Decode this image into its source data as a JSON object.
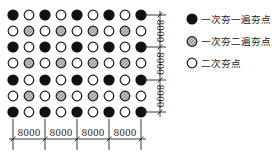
{
  "diagram": {
    "type": "compaction-point-layout",
    "grid": {
      "legend_codes": {
        "F": "first-pass-first-round",
        "H": "first-pass-second-round",
        "O": "second-pass"
      },
      "rows": [
        "FOFOFOFOF",
        "OHOHOHOHO",
        "FOFOFOFOF",
        "OHOHOHOHO",
        "FOFOFOFOF",
        "OHOHOHOHO",
        "FOFOFOFOF"
      ],
      "col_x": [
        13,
        29,
        45,
        61,
        77,
        93,
        109,
        125,
        141
      ],
      "row_y": [
        15,
        31,
        47,
        63,
        80,
        96,
        112
      ]
    },
    "dimensions": {
      "vertical": {
        "labels": [
          "8000",
          "8000",
          "8000"
        ]
      },
      "horizontal": {
        "labels": [
          "8000",
          "8000",
          "8000",
          "8000"
        ]
      }
    },
    "legend": {
      "items": [
        {
          "symbol": "filled-black-circle",
          "label": "一次夯一遍夯点"
        },
        {
          "symbol": "hatched-circle",
          "label": "一次夯二遍夯点"
        },
        {
          "symbol": "open-circle",
          "label": "二次夯点"
        }
      ]
    },
    "colors": {
      "filled": "#111111",
      "hatched_fill": "#9a9a9a",
      "stroke": "#1a1a1a",
      "background": "#ffffff"
    }
  }
}
